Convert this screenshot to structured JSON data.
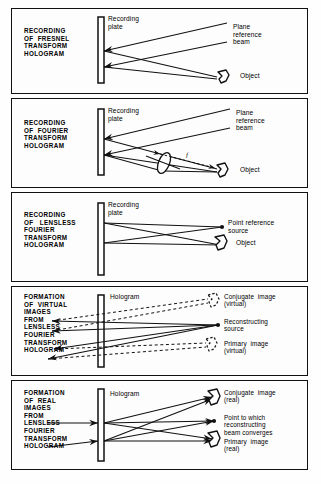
{
  "figure": {
    "background_color": "#fefefe",
    "ink_color": "#111111",
    "panel_count": 5
  },
  "panels": [
    {
      "id": "panel-fresnel-recording",
      "caption": "RECORDING\nOF  FRESNEL\nTRANSFORM\nHOLOGRAM",
      "caption_lines": [
        "RECORDING",
        "OF  FRESNEL",
        "TRANSFORM",
        "HOLOGRAM"
      ],
      "plate_label": "Recording\nplate",
      "plate_label_lines": [
        "Recording",
        "plate"
      ],
      "right_labels": [
        {
          "name": "plane-reference-beam",
          "text": "Plane\nreference\nbeam",
          "lines": [
            "Plane",
            "reference",
            "beam"
          ]
        },
        {
          "name": "object",
          "text": "Object",
          "lines": [
            "Object"
          ]
        }
      ],
      "elements": {
        "plate": "recording-plate",
        "object_style": "solid-blob",
        "beams": [
          "plane reference beam (two parallel rays with arrowheads)",
          "object beams (two rays to object)"
        ]
      }
    },
    {
      "id": "panel-fourier-recording",
      "caption": "RECORDING\nOF  FOURIER\nTRANSFORM\nHOLOGRAM",
      "caption_lines": [
        "RECORDING",
        "OF  FOURIER",
        "TRANSFORM",
        "HOLOGRAM"
      ],
      "plate_label": "Recording\nplate",
      "plate_label_lines": [
        "Recording",
        "plate"
      ],
      "right_labels": [
        {
          "name": "plane-reference-beam",
          "text": "Plane\nreference\nbeam",
          "lines": [
            "Plane",
            "reference",
            "beam"
          ]
        },
        {
          "name": "object",
          "text": "Object",
          "lines": [
            "Object"
          ]
        }
      ],
      "focal_marker": "f",
      "elements": {
        "plate": "recording-plate",
        "lens": "converging-lens-ellipse",
        "object_style": "solid-blob",
        "beams": [
          "plane reference beam",
          "object beams through lens"
        ]
      }
    },
    {
      "id": "panel-lensless-fourier-recording",
      "caption": "RECORDING\nOF   LENSLESS\nFOURIER\nTRANSFORM\nHOLOGRAM",
      "caption_lines": [
        "RECORDING",
        "OF   LENSLESS",
        "FOURIER",
        "TRANSFORM",
        "HOLOGRAM"
      ],
      "plate_label": "Recording\nplate",
      "plate_label_lines": [
        "Recording",
        "plate"
      ],
      "right_labels": [
        {
          "name": "point-reference-source",
          "text": "Point reference\nsource",
          "lines": [
            "Point reference",
            "source"
          ]
        },
        {
          "name": "object",
          "text": "Object",
          "lines": [
            "Object"
          ]
        }
      ],
      "elements": {
        "plate": "recording-plate",
        "object_style": "solid-blob",
        "point_source_style": "solid-dot",
        "beams": [
          "crossed rays from point reference source and object"
        ]
      }
    },
    {
      "id": "panel-virtual-image-formation",
      "caption": "FORMATION\nOF  VIRTUAL\nIMAGES\nFROM\nLENSLESS\nFOURIER\nTRANSFORM\nHOLOGRAM",
      "caption_lines": [
        "FORMATION",
        "OF  VIRTUAL",
        "IMAGES",
        "FROM",
        "LENSLESS",
        "FOURIER",
        "TRANSFORM",
        "HOLOGRAM"
      ],
      "plate_label": "Hologram",
      "plate_label_lines": [
        "Hologram"
      ],
      "right_labels": [
        {
          "name": "conjugate-image-virtual",
          "text": "Conjugate  image\n(virtual)",
          "lines": [
            "Conjugate  image",
            "(virtual)"
          ]
        },
        {
          "name": "reconstructing-source",
          "text": "Reconstructing\nsource",
          "lines": [
            "Reconstructing",
            "source"
          ]
        },
        {
          "name": "primary-image-virtual",
          "text": "Primary  image\n(virtual)",
          "lines": [
            "Primary  image",
            "(virtual)"
          ]
        }
      ],
      "elements": {
        "plate": "hologram-plate",
        "image_style": "dashed-blob",
        "source_style": "solid-dot",
        "beams": [
          "diverging reconstructed rays with leftward arrowheads",
          "dashed virtual ray extensions"
        ]
      }
    },
    {
      "id": "panel-real-image-formation",
      "caption": "FORMATION\nOF  REAL\nIMAGES\nFROM\nLENSLESS\nFOURIER\nTRANSFORM\nHOLOGRAM",
      "caption_lines": [
        "FORMATION",
        "OF  REAL",
        "IMAGES",
        "FROM",
        "LENSLESS",
        "FOURIER",
        "TRANSFORM",
        "HOLOGRAM"
      ],
      "plate_label": "Hologram",
      "plate_label_lines": [
        "Hologram"
      ],
      "right_labels": [
        {
          "name": "conjugate-image-real",
          "text": "Conjugate  image\n(real)",
          "lines": [
            "Conjugate  image",
            "(real)"
          ]
        },
        {
          "name": "point-to-which-beam-converges",
          "text": "Point to which\nreconstructing\nbeam converges",
          "lines": [
            "Point to which",
            "reconstructing",
            "beam converges"
          ]
        },
        {
          "name": "primary-image-real",
          "text": "Primary  image\n(real)",
          "lines": [
            "Primary  image",
            "(real)"
          ]
        }
      ],
      "elements": {
        "plate": "hologram-plate",
        "image_style": "solid-blob",
        "convergence_point_style": "solid-dot",
        "beams": [
          "converging reconstructed rays with rightward arrowheads"
        ]
      }
    }
  ]
}
